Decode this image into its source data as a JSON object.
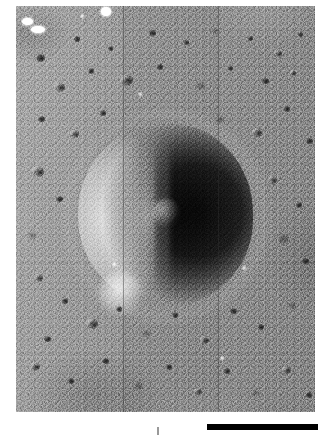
{
  "figure": {
    "kind": "grayscale orbital photograph",
    "caption": ""
  },
  "photo": {
    "alt_text": "Oblique grayscale orbital photograph of a cratered lunar mare surface. A large degraded impact crater sits near the center, its western inner wall brightly sunlit and its eastern interior filled with deep shadow. Smaller craters of many sizes pepper the surrounding regolith. Faint vertical framelet seams from the scanned mosaic run top to bottom.",
    "bounds": {
      "left": 16,
      "top": 6,
      "width": 299,
      "height": 406
    },
    "illumination": "sun from the west (left)",
    "seams": [
      {
        "name": "framelet-seam-left",
        "x": 107
      },
      {
        "name": "framelet-seam-right",
        "x": 202
      }
    ],
    "fiducial_marks": [
      {
        "name": "fiducial-mark-1",
        "x": 6,
        "y": 12,
        "w": 11,
        "h": 7
      },
      {
        "name": "fiducial-mark-2",
        "x": 15,
        "y": 20,
        "w": 14,
        "h": 7
      },
      {
        "name": "fiducial-mark-3",
        "x": 85,
        "y": 1,
        "w": 10,
        "h": 9
      }
    ]
  },
  "main_crater": {
    "name": "central-impact-crater",
    "center_x": 150,
    "center_y": 209,
    "diameter_px": 178,
    "shadow_side": "east",
    "sunlit_side": "west",
    "has_central_peak": true
  },
  "small_craters": [
    {
      "x": 20,
      "y": 48,
      "s": 9,
      "t": "dark"
    },
    {
      "x": 58,
      "y": 30,
      "s": 6,
      "t": "dark"
    },
    {
      "x": 92,
      "y": 40,
      "s": 5,
      "t": "dark"
    },
    {
      "x": 133,
      "y": 24,
      "s": 7,
      "t": "dark"
    },
    {
      "x": 168,
      "y": 34,
      "s": 5,
      "t": "dark"
    },
    {
      "x": 196,
      "y": 22,
      "s": 6,
      "t": "soft"
    },
    {
      "x": 232,
      "y": 30,
      "s": 5,
      "t": "dark"
    },
    {
      "x": 258,
      "y": 44,
      "s": 8,
      "t": "bowl"
    },
    {
      "x": 282,
      "y": 26,
      "s": 5,
      "t": "dark"
    },
    {
      "x": 38,
      "y": 76,
      "s": 11,
      "t": "bowl"
    },
    {
      "x": 72,
      "y": 62,
      "s": 6,
      "t": "dark"
    },
    {
      "x": 104,
      "y": 68,
      "s": 13,
      "t": "bowl"
    },
    {
      "x": 141,
      "y": 58,
      "s": 6,
      "t": "dark"
    },
    {
      "x": 180,
      "y": 76,
      "s": 9,
      "t": "soft"
    },
    {
      "x": 212,
      "y": 60,
      "s": 5,
      "t": "dark"
    },
    {
      "x": 246,
      "y": 72,
      "s": 7,
      "t": "dark"
    },
    {
      "x": 274,
      "y": 64,
      "s": 6,
      "t": "bowl"
    },
    {
      "x": 22,
      "y": 110,
      "s": 7,
      "t": "dark"
    },
    {
      "x": 54,
      "y": 124,
      "s": 9,
      "t": "bowl"
    },
    {
      "x": 84,
      "y": 104,
      "s": 6,
      "t": "dark"
    },
    {
      "x": 200,
      "y": 110,
      "s": 8,
      "t": "soft"
    },
    {
      "x": 236,
      "y": 122,
      "s": 10,
      "t": "bowl"
    },
    {
      "x": 268,
      "y": 100,
      "s": 6,
      "t": "dark"
    },
    {
      "x": 290,
      "y": 132,
      "s": 7,
      "t": "dark"
    },
    {
      "x": 16,
      "y": 160,
      "s": 12,
      "t": "bowl"
    },
    {
      "x": 40,
      "y": 190,
      "s": 7,
      "t": "dark"
    },
    {
      "x": 12,
      "y": 226,
      "s": 8,
      "t": "soft"
    },
    {
      "x": 252,
      "y": 170,
      "s": 9,
      "t": "bowl"
    },
    {
      "x": 280,
      "y": 196,
      "s": 6,
      "t": "dark"
    },
    {
      "x": 262,
      "y": 228,
      "s": 11,
      "t": "soft"
    },
    {
      "x": 286,
      "y": 252,
      "s": 7,
      "t": "dark"
    },
    {
      "x": 18,
      "y": 268,
      "s": 9,
      "t": "bowl"
    },
    {
      "x": 46,
      "y": 292,
      "s": 6,
      "t": "dark"
    },
    {
      "x": 70,
      "y": 312,
      "s": 12,
      "t": "bowl"
    },
    {
      "x": 28,
      "y": 330,
      "s": 7,
      "t": "dark"
    },
    {
      "x": 100,
      "y": 300,
      "s": 6,
      "t": "dark"
    },
    {
      "x": 126,
      "y": 324,
      "s": 8,
      "t": "soft"
    },
    {
      "x": 156,
      "y": 306,
      "s": 6,
      "t": "dark"
    },
    {
      "x": 184,
      "y": 330,
      "s": 9,
      "t": "bowl"
    },
    {
      "x": 214,
      "y": 302,
      "s": 7,
      "t": "dark"
    },
    {
      "x": 242,
      "y": 318,
      "s": 6,
      "t": "dark"
    },
    {
      "x": 272,
      "y": 296,
      "s": 8,
      "t": "soft"
    },
    {
      "x": 14,
      "y": 356,
      "s": 10,
      "t": "bowl"
    },
    {
      "x": 52,
      "y": 372,
      "s": 6,
      "t": "dark"
    },
    {
      "x": 86,
      "y": 352,
      "s": 7,
      "t": "dark"
    },
    {
      "x": 118,
      "y": 376,
      "s": 9,
      "t": "soft"
    },
    {
      "x": 150,
      "y": 358,
      "s": 6,
      "t": "dark"
    },
    {
      "x": 178,
      "y": 382,
      "s": 8,
      "t": "bowl"
    },
    {
      "x": 208,
      "y": 362,
      "s": 6,
      "t": "dark"
    },
    {
      "x": 236,
      "y": 384,
      "s": 7,
      "t": "soft"
    },
    {
      "x": 266,
      "y": 360,
      "s": 9,
      "t": "bowl"
    },
    {
      "x": 290,
      "y": 386,
      "s": 6,
      "t": "dark"
    },
    {
      "x": 64,
      "y": 8,
      "s": 5,
      "t": "bright"
    },
    {
      "x": 122,
      "y": 86,
      "s": 5,
      "t": "bright"
    },
    {
      "x": 226,
      "y": 260,
      "s": 5,
      "t": "bright"
    },
    {
      "x": 96,
      "y": 256,
      "s": 5,
      "t": "bright"
    },
    {
      "x": 204,
      "y": 350,
      "s": 5,
      "t": "bright"
    }
  ],
  "scale_bar": {
    "name": "scale-bar",
    "label": "",
    "color": "#000000",
    "left": 207,
    "top": 424,
    "length_px": 111,
    "thickness_px": 6
  },
  "colors": {
    "background": "#ffffff",
    "regolith_mid": "#8d8d8d",
    "shadow": "#161616",
    "highlight": "#f2f2f2",
    "scale_bar": "#000000"
  }
}
